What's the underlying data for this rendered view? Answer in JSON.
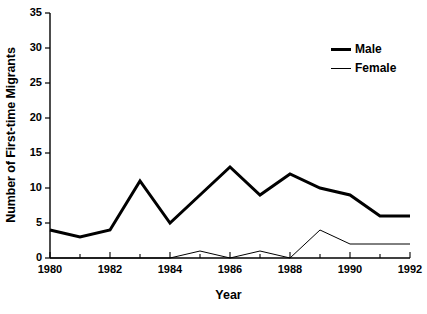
{
  "chart_data": {
    "type": "line",
    "title": "",
    "xlabel": "Year",
    "ylabel": "Number of First-time Migrants",
    "x": [
      1980,
      1981,
      1982,
      1983,
      1984,
      1985,
      1986,
      1987,
      1988,
      1989,
      1990,
      1991,
      1992
    ],
    "xlim": [
      1980,
      1992
    ],
    "ylim": [
      0,
      35
    ],
    "yticks": [
      0,
      5,
      10,
      15,
      20,
      25,
      30,
      35
    ],
    "ytick_labels": [
      "0",
      "5",
      "10",
      "15",
      "20",
      "25",
      "30",
      "35"
    ],
    "xticks": [
      1980,
      1982,
      1984,
      1986,
      1988,
      1990,
      1992
    ],
    "xtick_labels": [
      "1980",
      "1982",
      "1984",
      "1986",
      "1988",
      "1990",
      "1992"
    ],
    "grid": false,
    "legend_position": "top-right",
    "series": [
      {
        "name": "Male",
        "values": [
          4,
          3,
          4,
          11,
          5,
          9,
          13,
          9,
          12,
          10,
          9,
          6,
          6
        ],
        "color": "#000000",
        "line_width": 3
      },
      {
        "name": "Female",
        "values": [
          0,
          0,
          0,
          0,
          0,
          1,
          0,
          1,
          0,
          4,
          2,
          2,
          2
        ],
        "color": "#000000",
        "line_width": 1
      }
    ]
  },
  "legend": {
    "items": [
      {
        "label": "Male",
        "style": "thick"
      },
      {
        "label": "Female",
        "style": "thin"
      }
    ]
  },
  "axes": {
    "x_title": "Year",
    "y_title": "Number of First-time Migrants"
  }
}
